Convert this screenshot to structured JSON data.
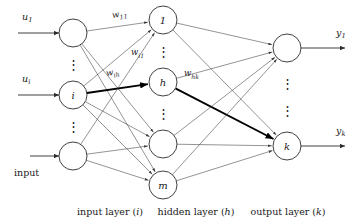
{
  "figure": {
    "type": "neural-network-diagram",
    "title": "",
    "background_color": "#ffffff",
    "stroke_color": "#2b2b2b",
    "bold_stroke_color": "#000000",
    "width": 357,
    "height": 221
  },
  "layers": [
    {
      "id": "input",
      "caption": "input layer (i)",
      "caption_word": "input layer",
      "caption_symbol": "i",
      "caption_x": 110,
      "caption_y": 211,
      "x": 73,
      "node_radius": 14,
      "nodes": [
        {
          "label": "",
          "cy": 33,
          "name": "input-node-1"
        },
        {
          "label": "i",
          "cy": 95,
          "name": "input-node-i"
        },
        {
          "label": "",
          "cy": 156,
          "name": "input-node-last"
        }
      ],
      "ellipses": [
        {
          "cy": 64,
          "glyph": "⋮"
        },
        {
          "cy": 126,
          "glyph": "⋮"
        }
      ]
    },
    {
      "id": "hidden",
      "caption": "hidden layer (h)",
      "caption_word": "hidden layer",
      "caption_symbol": "h",
      "caption_x": 196,
      "caption_y": 211,
      "x": 163,
      "node_radius": 14,
      "nodes": [
        {
          "label": "1",
          "cy": 20,
          "name": "hidden-node-1"
        },
        {
          "label": "h",
          "cy": 82,
          "name": "hidden-node-h"
        },
        {
          "label": "",
          "cy": 144,
          "name": "hidden-node-blank"
        },
        {
          "label": "m",
          "cy": 185,
          "name": "hidden-node-m"
        }
      ],
      "ellipses": [
        {
          "cy": 51,
          "glyph": "⋮"
        },
        {
          "cy": 113,
          "glyph": "⋮"
        }
      ]
    },
    {
      "id": "output",
      "caption": "output layer (k)",
      "caption_word": "output layer",
      "caption_symbol": "k",
      "caption_x": 288,
      "caption_y": 211,
      "x": 287,
      "node_radius": 14,
      "nodes": [
        {
          "label": "",
          "cy": 48,
          "name": "output-node-1"
        },
        {
          "label": "k",
          "cy": 146,
          "name": "output-node-k"
        }
      ],
      "ellipses": [
        {
          "cy": 83,
          "glyph": "⋮"
        },
        {
          "cy": 110,
          "glyph": "⋮"
        }
      ]
    }
  ],
  "inputs": [
    {
      "name": "input-arrow-u1",
      "label_base": "u",
      "label_sub": "1",
      "label_x": 22,
      "label_y": 16,
      "line_x1": 18,
      "line_x2": 59,
      "line_y": 33
    },
    {
      "name": "input-arrow-ui",
      "label_base": "u",
      "label_sub": "i",
      "label_x": 22,
      "label_y": 78,
      "line_x1": 18,
      "line_x2": 59,
      "line_y": 95
    },
    {
      "name": "input-arrow-input",
      "label_base": "input",
      "label_sub": "",
      "label_x": 14,
      "label_y": 172,
      "line_x1": 30,
      "line_x2": 59,
      "line_y": 156
    }
  ],
  "outputs": [
    {
      "name": "output-arrow-y1",
      "label_base": "y",
      "label_sub": "1",
      "label_x": 336,
      "label_y": 32,
      "line_x1": 301,
      "line_x2": 345,
      "line_y": 48
    },
    {
      "name": "output-arrow-yk",
      "label_base": "y",
      "label_sub": "k",
      "label_x": 336,
      "label_y": 130,
      "line_x1": 301,
      "line_x2": 345,
      "line_y": 146
    }
  ],
  "weights": [
    {
      "name": "weight-label-w11",
      "base": "w",
      "sub": "11",
      "x": 112,
      "y": 15,
      "rotate": -9
    },
    {
      "name": "weight-label-wi1",
      "base": "w",
      "sub": "i1",
      "x": 131,
      "y": 52,
      "rotate": 0
    },
    {
      "name": "weight-label-wih",
      "base": "w",
      "sub": "ih",
      "x": 106,
      "y": 73,
      "rotate": -9
    },
    {
      "name": "weight-label-whk",
      "base": "w",
      "sub": "hk",
      "x": 184,
      "y": 73,
      "rotate": 0
    }
  ],
  "edges_input_to_hidden": [
    {
      "from": 0,
      "to": 0,
      "bold": false
    },
    {
      "from": 0,
      "to": 2,
      "bold": false
    },
    {
      "from": 0,
      "to": 3,
      "bold": false
    },
    {
      "from": 1,
      "to": 0,
      "bold": false
    },
    {
      "from": 1,
      "to": 1,
      "bold": true
    },
    {
      "from": 1,
      "to": 2,
      "bold": false
    },
    {
      "from": 1,
      "to": 3,
      "bold": false
    },
    {
      "from": 2,
      "to": 0,
      "bold": false
    },
    {
      "from": 2,
      "to": 2,
      "bold": false
    },
    {
      "from": 2,
      "to": 3,
      "bold": false
    }
  ],
  "edges_hidden_to_output": [
    {
      "from": 0,
      "to": 0,
      "bold": false
    },
    {
      "from": 0,
      "to": 1,
      "bold": false
    },
    {
      "from": 1,
      "to": 0,
      "bold": false
    },
    {
      "from": 1,
      "to": 1,
      "bold": true
    },
    {
      "from": 2,
      "to": 0,
      "bold": false
    },
    {
      "from": 2,
      "to": 1,
      "bold": false
    },
    {
      "from": 3,
      "to": 0,
      "bold": false
    },
    {
      "from": 3,
      "to": 1,
      "bold": false
    }
  ]
}
